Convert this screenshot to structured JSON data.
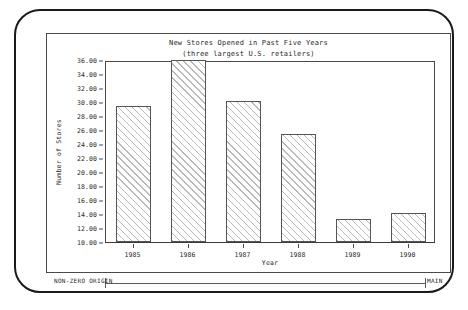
{
  "chart_data": {
    "type": "bar",
    "title": "New Stores Opened in Past Five Years",
    "subtitle": "(three largest U.S. retailers)",
    "xlabel": "Year",
    "ylabel": "Number of Stores",
    "categories": [
      "1985",
      "1986",
      "1987",
      "1988",
      "1989",
      "1990"
    ],
    "values": [
      29.4,
      36.0,
      30.2,
      25.4,
      13.3,
      14.2
    ],
    "ylim": [
      10.0,
      36.0
    ],
    "ytick_step": 2.0,
    "ytick_labels": [
      "36.00",
      "34.00",
      "32.00",
      "30.00",
      "28.00",
      "26.00",
      "24.00",
      "22.00",
      "20.00",
      "18.00",
      "16.00",
      "14.00",
      "12.00",
      "10.00"
    ],
    "ytick_values": [
      36,
      34,
      32,
      30,
      28,
      26,
      24,
      22,
      20,
      18,
      16,
      14,
      12,
      10
    ],
    "grid": false,
    "legend": false,
    "bar_fill": "diagonal-hatch",
    "bar_border_color": "#555555",
    "hatch_color": "#b9b9b9"
  },
  "annotation": {
    "left_label": "NON-ZERO ORIGIN",
    "right_label": "MAIN"
  }
}
